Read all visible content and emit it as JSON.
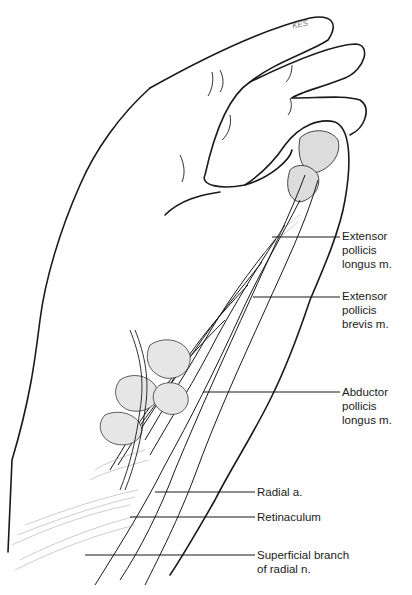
{
  "figure": {
    "signature": "KES",
    "colors": {
      "background": "#ffffff",
      "line": "#1a1a1a",
      "shade": "#b8b8b8"
    }
  },
  "labels": [
    {
      "id": "epl",
      "lines": [
        "Extensor",
        "pollicis",
        "longus m."
      ],
      "leader": {
        "x1": 272,
        "x2": 340,
        "y": 237
      },
      "text_x": 342,
      "text_y": 229
    },
    {
      "id": "epb",
      "lines": [
        "Extensor",
        "pollicis",
        "brevis m."
      ],
      "leader": {
        "x1": 253,
        "x2": 340,
        "y": 297
      },
      "text_x": 342,
      "text_y": 289
    },
    {
      "id": "apl",
      "lines": [
        "Abductor",
        "pollicis",
        "longus m."
      ],
      "leader": {
        "x1": 203,
        "x2": 340,
        "y": 392
      },
      "text_x": 342,
      "text_y": 385
    },
    {
      "id": "radial-a",
      "lines": [
        "Radial a."
      ],
      "leader": {
        "x1": 155,
        "x2": 255,
        "y": 492
      },
      "text_x": 257,
      "text_y": 485
    },
    {
      "id": "retinaculum",
      "lines": [
        "Retinaculum"
      ],
      "leader": {
        "x1": 130,
        "x2": 255,
        "y": 517
      },
      "text_x": 257,
      "text_y": 510
    },
    {
      "id": "superficial-branch",
      "lines": [
        "Superficial branch",
        "of radial n."
      ],
      "leader": {
        "x1": 85,
        "x2": 255,
        "y": 555
      },
      "text_x": 257,
      "text_y": 548
    }
  ]
}
